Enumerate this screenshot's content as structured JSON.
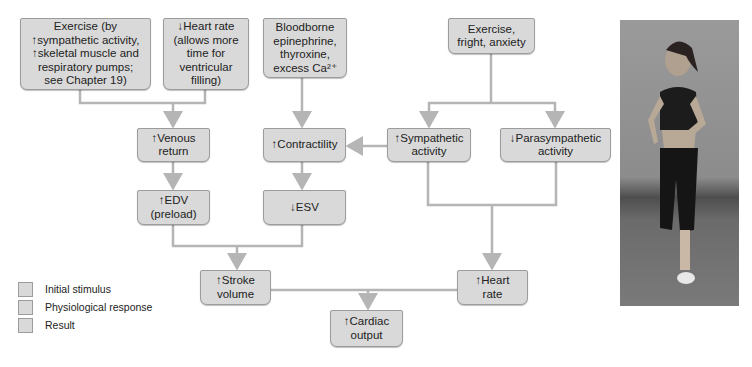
{
  "diagram": {
    "boxes": {
      "exercise_pumps": "Exercise (by\n↑sympathetic activity,\n↑skeletal muscle and\nrespiratory pumps;\nsee Chapter 19)",
      "low_heart_rate": "↓Heart rate\n(allows more\ntime for\nventricular\nfilling)",
      "bloodborne": "Bloodborne\nepinephrine,\nthyroxine,\nexcess Ca²⁺",
      "exercise_fright": "Exercise,\nfright, anxiety",
      "venous_return": "↑Venous\nreturn",
      "contractility": "↑Contractility",
      "sympathetic": "↑Sympathetic\nactivity",
      "parasympathetic": "↓Parasympathetic\nactivity",
      "edv": "↑EDV\n(preload)",
      "esv": "↓ESV",
      "stroke_volume": "↑Stroke\nvolume",
      "heart_rate": "↑Heart\nrate",
      "cardiac_output": "↑Cardiac\noutput"
    },
    "legend": [
      {
        "label": "Initial stimulus"
      },
      {
        "label": "Physiological response"
      },
      {
        "label": "Result"
      }
    ],
    "colors": {
      "box_fill": "#d9d9d9",
      "box_border": "#9c9c9c",
      "connector": "#b5b5b5"
    }
  },
  "photo": {
    "alt": "Woman jogging on a road"
  }
}
